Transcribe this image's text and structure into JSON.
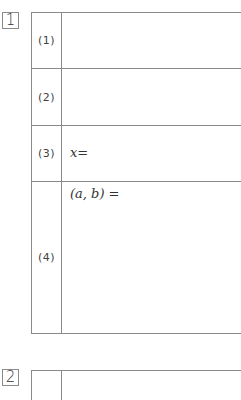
{
  "sections": [
    {
      "number": "1",
      "rows": [
        {
          "label": "(1)",
          "answer": ""
        },
        {
          "label": "(2)",
          "answer": ""
        },
        {
          "label": "(3)",
          "answer": "x="
        },
        {
          "label": "(4)",
          "answer": "(a,  b) ="
        }
      ]
    },
    {
      "number": "2",
      "rows": []
    }
  ],
  "colors": {
    "line": "#8a8a8a",
    "text": "#333333"
  }
}
